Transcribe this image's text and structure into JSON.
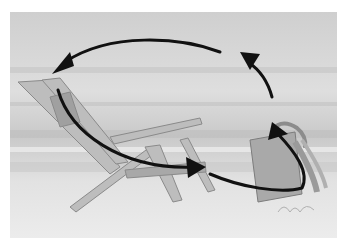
{
  "image": {
    "description": "Grayscale watercolor painting of a wooden beach chair and a wrapped gift bag on sand, with four black curved arrows forming a clockwise cycle",
    "signature": "illegible artist signature",
    "colors": {
      "background": "#ffffff",
      "sky": "#d8d8d8",
      "sand": "#e6e6e6",
      "chair": "#b8b8b8",
      "arrows": "#111111"
    },
    "arrows": [
      {
        "from": "top-right",
        "to": "chair top",
        "direction": "counterclockwise-left"
      },
      {
        "from": "chair seat back",
        "to": "chair front",
        "direction": "down-right"
      },
      {
        "from": "chair front",
        "to": "gift bag",
        "direction": "right, looping up"
      },
      {
        "from": "gift bag",
        "to": "top-right",
        "direction": "up"
      }
    ]
  }
}
